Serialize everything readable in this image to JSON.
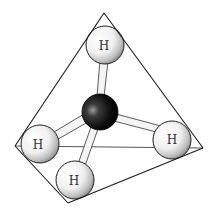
{
  "diagram": {
    "colors": {
      "background": "#ffffff",
      "edge": "#1a1a1a",
      "carbon": "#111111",
      "hydrogen": "#f2f2f2",
      "bond": "#f4f4f4"
    },
    "tetrahedron": {
      "apex": [
        104,
        13
      ],
      "left": [
        15,
        146
      ],
      "right": [
        203,
        148
      ],
      "bottom": [
        68,
        203
      ]
    },
    "center_atom": {
      "label": "",
      "element": "C",
      "x": 100,
      "y": 112,
      "r": 18
    },
    "atoms": [
      {
        "id": "h-top",
        "label": "H",
        "x": 105,
        "y": 45,
        "r": 19
      },
      {
        "id": "h-left",
        "label": "H",
        "x": 40,
        "y": 144,
        "r": 19
      },
      {
        "id": "h-right",
        "label": "H",
        "x": 172,
        "y": 140,
        "r": 19
      },
      {
        "id": "h-bottom",
        "label": "H",
        "x": 75,
        "y": 180,
        "r": 19
      }
    ]
  }
}
